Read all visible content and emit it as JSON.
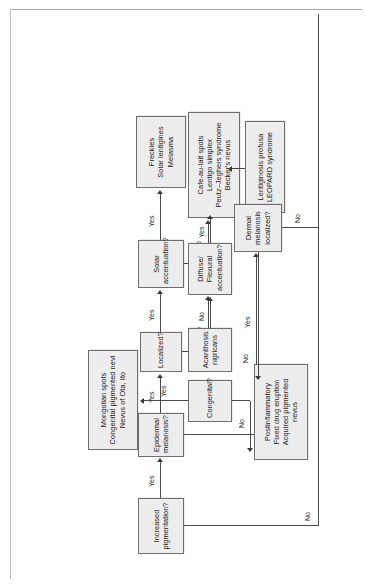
{
  "diagram": {
    "type": "flowchart",
    "orientation": "rotated-90-ccw",
    "colors": {
      "node_fill": "#ededed",
      "node_border": "#6e6e6e",
      "edge": "#4a4a4a",
      "text": "#1a1a1a",
      "page_rule": "#a9a9a9"
    },
    "nodes": {
      "increased_pigmentation": {
        "id": "increased-pigmentation",
        "kind": "decision",
        "lines": [
          "Increased",
          "pigmentation?"
        ]
      },
      "epidermal_melanosis": {
        "id": "epidermal-melanosis",
        "kind": "decision",
        "lines": [
          "Epidermal",
          "melanosis?"
        ]
      },
      "localized": {
        "id": "localized",
        "kind": "decision",
        "lines": [
          "Localized?"
        ]
      },
      "solar_accentuation": {
        "id": "solar-accentuation",
        "kind": "decision",
        "lines": [
          "Solar",
          "accentuation?"
        ]
      },
      "freckles_group": {
        "id": "freckles-group",
        "kind": "outcome",
        "lines": [
          "Freckles",
          "Solar lentigines",
          "Melasma"
        ]
      },
      "cafe_au_lait_group": {
        "id": "cafe-au-lait-group",
        "kind": "outcome",
        "lines": [
          "Cafe-au-lait spots",
          "Lentigo simplex",
          "Peutz–Jeghers syndrome",
          "Becker's nevus"
        ]
      },
      "diffuse_flexural": {
        "id": "diffuse-flexural-accentuation",
        "kind": "decision",
        "lines": [
          "Diffuse/",
          "Flexural",
          "accentuation?"
        ]
      },
      "lentiginosis_group": {
        "id": "lentiginosis-group",
        "kind": "outcome",
        "lines": [
          "Lentiginosis profusa",
          "LEOPARD syndrome"
        ]
      },
      "acanthosis_nigricans": {
        "id": "acanthosis-nigricans",
        "kind": "outcome",
        "lines": [
          "Acanthosis",
          "nigricans"
        ]
      },
      "dermal_melanosis": {
        "id": "dermal-melanosis-localized",
        "kind": "decision",
        "lines": [
          "Dermal",
          "melanosis",
          "localized?"
        ]
      },
      "congenital": {
        "id": "congenital",
        "kind": "decision",
        "lines": [
          "Congenital?"
        ]
      },
      "mongolian_group": {
        "id": "mongolian-group",
        "kind": "outcome",
        "lines": [
          "Mongolian spots",
          "Congenital pigmented nevi",
          "Nevus of Ota, Ito"
        ]
      },
      "postinflammatory_group": {
        "id": "postinflammatory-group",
        "kind": "outcome",
        "lines": [
          "Postinflammatory",
          "Fixed drug eruption",
          "Acquired pigmented",
          "nevus"
        ]
      }
    },
    "edge_labels": {
      "inc_to_epi": "Yes",
      "inc_no": "No",
      "epi_to_loc": "Yes",
      "epi_no": "No",
      "loc_to_solar": "Yes",
      "loc_no": "No",
      "solar_yes": "Yes",
      "solar_no": "No",
      "diffuse_yes": "Yes",
      "diffuse_no": "No",
      "dermal_yes": "Yes",
      "dermal_no": "No",
      "cong_yes": "Yes",
      "cong_no": "No"
    }
  }
}
